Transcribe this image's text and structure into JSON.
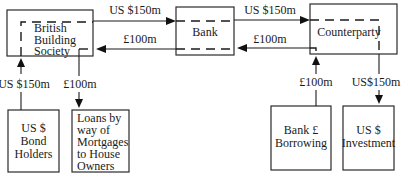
{
  "diagram": {
    "type": "currency swap flow diagram",
    "nodes": {
      "building_society": {
        "lines": [
          "British",
          "Building",
          "Society"
        ]
      },
      "bank": {
        "label": "Bank"
      },
      "counterparty": {
        "label": "Counterparty"
      },
      "bond_holders": {
        "lines": [
          "US $",
          "Bond",
          "Holders"
        ]
      },
      "mortgages": {
        "lines": [
          "Loans by",
          "way of",
          "Mortgages",
          "to House",
          "Owners"
        ]
      },
      "bank_borrowing": {
        "lines": [
          "Bank £",
          "Borrowing"
        ]
      },
      "us_investment": {
        "lines": [
          "US $",
          "Investment"
        ]
      }
    },
    "edges": {
      "bs_to_bank": {
        "label": "US $150m",
        "from": "building_society",
        "to": "bank"
      },
      "bank_to_bs": {
        "label": "£100m",
        "from": "bank",
        "to": "building_society"
      },
      "bank_to_cp": {
        "label": "US $150m",
        "from": "bank",
        "to": "counterparty"
      },
      "cp_to_bank": {
        "label": "£100m",
        "from": "counterparty",
        "to": "bank"
      },
      "bondholders_to_bs": {
        "label": "US $150m",
        "from": "bond_holders",
        "to": "building_society"
      },
      "bs_to_mortgages": {
        "label": "£100m",
        "from": "building_society",
        "to": "mortgages"
      },
      "borrowing_to_cp": {
        "label": "£100m",
        "from": "bank_borrowing",
        "to": "counterparty"
      },
      "cp_to_investment": {
        "label": "US$150m",
        "from": "counterparty",
        "to": "us_investment"
      }
    }
  }
}
